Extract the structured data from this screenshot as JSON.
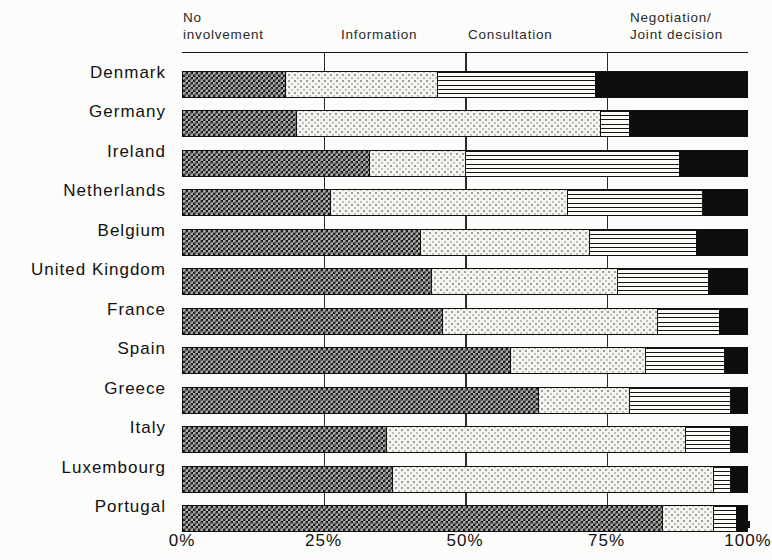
{
  "header": {
    "category_labels": [
      {
        "key": "no-involvement",
        "line1": "No",
        "line2": "involvement"
      },
      {
        "key": "information",
        "line1": "Information",
        "line2": ""
      },
      {
        "key": "consultation",
        "line1": "Consultation",
        "line2": ""
      },
      {
        "key": "negotiation-joint-decision",
        "line1": "Negotiation/",
        "line2": "Joint decision"
      }
    ]
  },
  "chart_data": {
    "type": "bar",
    "orientation": "horizontal",
    "stacked": true,
    "unit": "percent",
    "categories": [
      "Denmark",
      "Germany",
      "Ireland",
      "Netherlands",
      "Belgium",
      "United Kingdom",
      "France",
      "Spain",
      "Greece",
      "Italy",
      "Luxembourg",
      "Portugal"
    ],
    "series": [
      {
        "name": "No involvement",
        "key": "no-involvement",
        "pattern": "checker-gray",
        "values": [
          18,
          20,
          33,
          26,
          42,
          44,
          46,
          58,
          63,
          36,
          37,
          85
        ]
      },
      {
        "name": "Information",
        "key": "information",
        "pattern": "light-stipple",
        "values": [
          27,
          54,
          17,
          42,
          30,
          33,
          38,
          24,
          16,
          53,
          57,
          9
        ]
      },
      {
        "name": "Consultation",
        "key": "consultation",
        "pattern": "horizontal-lines",
        "values": [
          28,
          5,
          38,
          24,
          19,
          16,
          11,
          14,
          18,
          8,
          3,
          4
        ]
      },
      {
        "name": "Negotiation/Joint decision",
        "key": "negotiation-joint-decision",
        "pattern": "solid-black",
        "values": [
          27,
          21,
          12,
          8,
          9,
          7,
          5,
          4,
          3,
          3,
          3,
          2
        ]
      }
    ],
    "x_axis": {
      "range": [
        0,
        100
      ],
      "tick_labels": [
        "0%",
        "25%",
        "50%",
        "75%",
        "100%"
      ],
      "tick_positions": [
        0,
        25,
        50,
        75,
        100
      ],
      "gridlines": [
        25,
        50,
        75
      ]
    },
    "colors": {
      "ink": "#141414",
      "paper": "#fcfcfa"
    },
    "title": "",
    "xlabel": "",
    "ylabel": ""
  }
}
